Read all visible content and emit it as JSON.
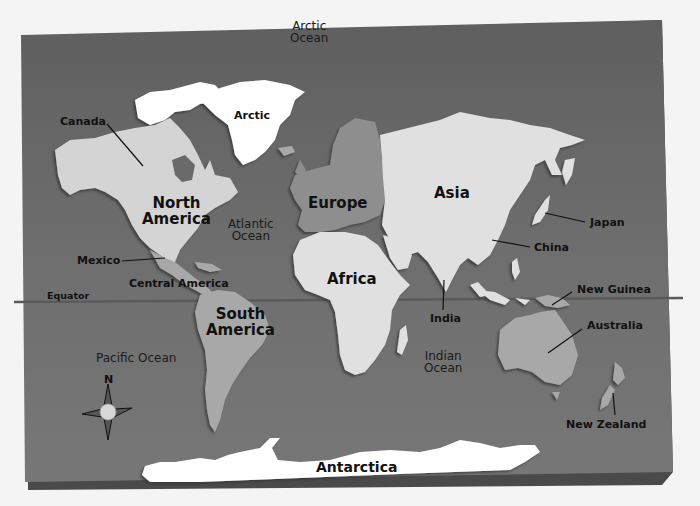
{
  "map": {
    "title": "World Map",
    "colors": {
      "page_bg": "#f4f4f4",
      "ocean": "#6b6b6b",
      "ocean_light": "#7a7a7a",
      "board_edge": "#4a4a4a",
      "land_light": "#d8d8d8",
      "land_white": "#ffffff",
      "land_mid": "#a8a8a8",
      "land_europe": "#8e8e8e",
      "equator_line": "#5a5a5a",
      "leader_line": "#111111"
    },
    "continents": {
      "north_america": "North\nAmerica",
      "south_america": "South\nAmerica",
      "europe": "Europe",
      "asia": "Asia",
      "africa": "Africa",
      "antarctica": "Antarctica",
      "arctic": "Arctic"
    },
    "regions": {
      "canada": "Canada",
      "mexico": "Mexico",
      "central_america": "Central America",
      "japan": "Japan",
      "china": "China",
      "india": "India",
      "new_guinea": "New Guinea",
      "australia": "Australia",
      "new_zealand": "New Zealand"
    },
    "oceans": {
      "arctic": "Arctic\nOcean",
      "atlantic": "Atlantic\nOcean",
      "pacific": "Pacific Ocean",
      "indian": "Indian\nOcean"
    },
    "equator_label": "Equator",
    "compass": {
      "icon": "compass-rose-icon",
      "north_label": "N"
    }
  }
}
